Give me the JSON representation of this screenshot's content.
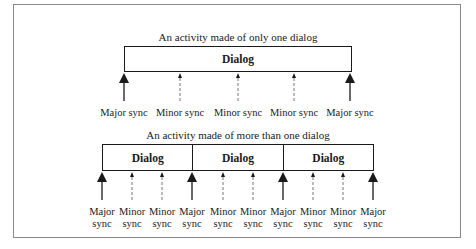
{
  "top_diagram": {
    "title": "An activity made of only one dialog",
    "dialogs": [
      "Dialog"
    ],
    "syncs": [
      {
        "type": "major",
        "label": "Major sync",
        "x": 124
      },
      {
        "type": "minor",
        "label": "Minor sync",
        "x": 180
      },
      {
        "type": "minor",
        "label": "Minor sync",
        "x": 238
      },
      {
        "type": "minor",
        "label": "Minor sync",
        "x": 294
      },
      {
        "type": "major",
        "label": "Major sync",
        "x": 350
      }
    ]
  },
  "bottom_diagram": {
    "title": "An activity made of more than one dialog",
    "dialogs": [
      "Dialog",
      "Dialog",
      "Dialog"
    ],
    "syncs": [
      {
        "type": "major",
        "label_line1": "Major",
        "label_line2": "sync",
        "x": 102
      },
      {
        "type": "minor",
        "label_line1": "Minor",
        "label_line2": "sync",
        "x": 132
      },
      {
        "type": "minor",
        "label_line1": "Minor",
        "label_line2": "sync",
        "x": 162
      },
      {
        "type": "major",
        "label_line1": "Major",
        "label_line2": "sync",
        "x": 192
      },
      {
        "type": "minor",
        "label_line1": "Minor",
        "label_line2": "sync",
        "x": 223
      },
      {
        "type": "minor",
        "label_line1": "Minor",
        "label_line2": "sync",
        "x": 253
      },
      {
        "type": "major",
        "label_line1": "Major",
        "label_line2": "sync",
        "x": 283
      },
      {
        "type": "minor",
        "label_line1": "Minor",
        "label_line2": "sync",
        "x": 313
      },
      {
        "type": "minor",
        "label_line1": "Minor",
        "label_line2": "sync",
        "x": 343
      },
      {
        "type": "major",
        "label_line1": "Major",
        "label_line2": "sync",
        "x": 373
      }
    ]
  }
}
